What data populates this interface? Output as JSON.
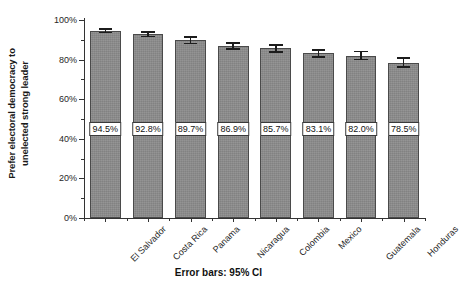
{
  "chart_data": {
    "type": "bar",
    "title": "",
    "subtitle": "",
    "xlabel": "",
    "ylabel": "Prefer electoral democracy to unelected strong leader",
    "ylabel_lines": [
      "Prefer electoral democracy to",
      "unelected strong leader"
    ],
    "categories": [
      "El Salvador",
      "Costa Rica",
      "Panama",
      "Nicaragua",
      "Colombia",
      "Mexico",
      "Guatemala",
      "Honduras"
    ],
    "values": [
      94.5,
      92.8,
      89.7,
      86.9,
      85.7,
      83.1,
      82.0,
      78.5
    ],
    "value_labels": [
      "94.5%",
      "92.8%",
      "89.7%",
      "86.9%",
      "85.7%",
      "83.1%",
      "82.0%",
      "78.5%"
    ],
    "error_low": [
      93.2,
      91.2,
      87.7,
      84.9,
      83.5,
      80.8,
      79.6,
      75.8
    ],
    "error_high": [
      95.8,
      94.4,
      91.7,
      88.9,
      87.9,
      85.4,
      84.4,
      81.2
    ],
    "error_type": "95% CI",
    "ylim": [
      0,
      100
    ],
    "ytick_values": [
      0,
      20,
      40,
      60,
      80,
      100
    ],
    "ytick_labels": [
      "0%",
      "20%",
      "40%",
      "60%",
      "80%",
      "100%"
    ],
    "yminor_values": [
      10,
      30,
      50,
      70,
      90
    ],
    "grid": false,
    "legend": "none",
    "caption": "Error bars: 95% CI",
    "bar_color": "#8b8b8b",
    "bar_edge_color": "#4a4a4a",
    "error_color": "#1c1c1c",
    "label_box_fill": "#ffffff",
    "label_box_border": "#3a3a3a",
    "axis_color": "#333333",
    "background": "#ffffff"
  }
}
